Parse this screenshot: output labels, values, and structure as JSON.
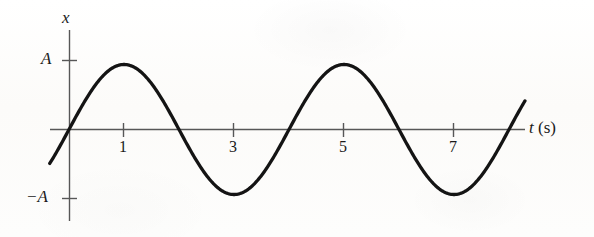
{
  "figure": {
    "background_color": "#fdfdfb",
    "ink_color": "#141414",
    "axis_color": "#555555"
  },
  "axes": {
    "y_label": "x",
    "x_label_symbol": "t",
    "x_label_unit": "(s)",
    "y_tick_top_label": "A",
    "y_tick_bottom_label": "−A",
    "x_tick_labels": [
      "1",
      "3",
      "5",
      "7"
    ]
  },
  "chart_data": {
    "type": "line",
    "title": "",
    "xlabel": "t (s)",
    "ylabel": "x",
    "xlim": [
      -0.35,
      8.3
    ],
    "ylim": [
      -1.45,
      1.45
    ],
    "grid": false,
    "legend": null,
    "xticks": [
      1,
      3,
      5,
      7
    ],
    "xtick_labels": [
      "1",
      "3",
      "5",
      "7"
    ],
    "yticks": [
      1,
      -1
    ],
    "ytick_labels": [
      "A",
      "−A"
    ],
    "annotations": [],
    "series": [
      {
        "name": "x(t) = A sin(πt/2)",
        "equation": "x = A sin(2πt/T), T = 4 s",
        "amplitude": 1,
        "period": 4,
        "phase": 0,
        "x": [
          -0.35,
          -0.2,
          0,
          0.25,
          0.5,
          0.75,
          1,
          1.25,
          1.5,
          1.75,
          2,
          2.25,
          2.5,
          2.75,
          3,
          3.25,
          3.5,
          3.75,
          4,
          4.25,
          4.5,
          4.75,
          5,
          5.25,
          5.5,
          5.75,
          6,
          6.25,
          6.5,
          6.75,
          7,
          7.25,
          7.5,
          7.75,
          8,
          8.15,
          8.3
        ],
        "y": [
          -0.53,
          -0.31,
          0,
          0.38,
          0.71,
          0.92,
          1,
          0.92,
          0.71,
          0.38,
          0,
          -0.38,
          -0.71,
          -0.92,
          -1,
          -0.92,
          -0.71,
          -0.38,
          0,
          0.38,
          0.71,
          0.92,
          1,
          0.92,
          0.71,
          0.38,
          0,
          -0.38,
          -0.71,
          -0.92,
          -1,
          -0.92,
          -0.71,
          -0.38,
          0,
          0.23,
          0.45
        ]
      }
    ],
    "key_points": {
      "maxima_t": [
        1,
        5
      ],
      "minima_t": [
        3,
        7
      ],
      "zero_crossings_t": [
        0,
        2,
        4,
        6,
        8
      ]
    }
  }
}
